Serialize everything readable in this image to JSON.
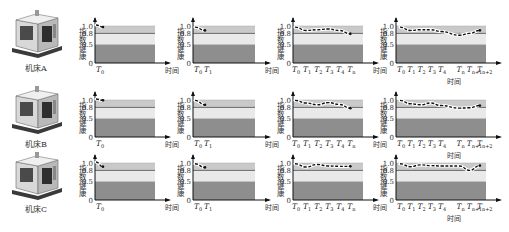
{
  "figure": {
    "machines": [
      {
        "label": "机床A"
      },
      {
        "label": "机床B"
      },
      {
        "label": "机床C"
      }
    ],
    "y_axis_label": "指数健康",
    "x_axis_label": "时间",
    "y_ticks": [
      "1.0",
      "0.8",
      "0.5",
      "0"
    ],
    "bands": {
      "high": "#c9c9c9",
      "mid": "#e9e9e9",
      "low": "#8e8e8e",
      "line08": "#6a6a6a"
    },
    "time_labels": {
      "c1": [
        {
          "t": "T",
          "s": "0"
        }
      ],
      "c2": [
        {
          "t": "T",
          "s": "0"
        },
        {
          "t": "T",
          "s": "1"
        }
      ],
      "c3": [
        {
          "t": "T",
          "s": "0"
        },
        {
          "t": "T",
          "s": "1"
        },
        {
          "t": "T",
          "s": "2"
        },
        {
          "t": "T",
          "s": "3"
        },
        {
          "t": "T",
          "s": "4"
        },
        {
          "t": "T",
          "s": "n"
        }
      ],
      "c4": [
        {
          "t": "T",
          "s": "0"
        },
        {
          "t": "T",
          "s": "1"
        },
        {
          "t": "T",
          "s": "2"
        },
        {
          "t": "T",
          "s": "3"
        },
        {
          "t": "T",
          "s": "4"
        },
        {
          "t": "T",
          "s": "n"
        },
        {
          "t": "T",
          "s": "n+1"
        },
        {
          "t": "T",
          "s": "n+2"
        }
      ]
    }
  },
  "chart_data": [
    {
      "type": "line",
      "machine": "机床A",
      "stage": 1,
      "x": [
        "T0"
      ],
      "values": [
        0.97
      ],
      "ylim": [
        0,
        1.1
      ],
      "xlabel": "时间",
      "ylabel": "指数健康",
      "bands": [
        0.5,
        0.8,
        1.0
      ]
    },
    {
      "type": "line",
      "machine": "机床A",
      "stage": 2,
      "x": [
        "T0",
        "T1"
      ],
      "values": [
        0.97,
        0.88
      ],
      "ylim": [
        0,
        1.1
      ],
      "xlabel": "时间",
      "ylabel": "指数健康"
    },
    {
      "type": "line",
      "machine": "机床A",
      "stage": 3,
      "x": [
        "T0",
        "T1",
        "T2",
        "T3",
        "T4",
        "Tn"
      ],
      "values": [
        0.97,
        0.88,
        0.9,
        0.92,
        0.88,
        0.79
      ],
      "ylim": [
        0,
        1.1
      ],
      "xlabel": "时间",
      "ylabel": "指数健康"
    },
    {
      "type": "line",
      "machine": "机床A",
      "stage": 4,
      "x": [
        "T0",
        "T1",
        "T2",
        "T3",
        "T4",
        "Tn",
        "Tn+1",
        "Tn+2"
      ],
      "values": [
        0.97,
        0.88,
        0.9,
        0.9,
        0.85,
        0.75,
        0.8,
        0.88
      ],
      "ylim": [
        0,
        1.1
      ],
      "xlabel": "时间",
      "ylabel": "指数健康"
    },
    {
      "type": "line",
      "machine": "机床B",
      "stage": 1,
      "x": [
        "T0"
      ],
      "values": [
        0.99
      ],
      "ylim": [
        0,
        1.1
      ],
      "xlabel": "时间",
      "ylabel": "指数健康"
    },
    {
      "type": "line",
      "machine": "机床B",
      "stage": 2,
      "x": [
        "T0",
        "T1"
      ],
      "values": [
        0.99,
        0.87
      ],
      "ylim": [
        0,
        1.1
      ],
      "xlabel": "时间",
      "ylabel": "指数健康"
    },
    {
      "type": "line",
      "machine": "机床B",
      "stage": 3,
      "x": [
        "T0",
        "T1",
        "T2",
        "T3",
        "T4",
        "Tn"
      ],
      "values": [
        0.99,
        0.92,
        0.87,
        0.93,
        0.88,
        0.78
      ],
      "ylim": [
        0,
        1.1
      ],
      "xlabel": "时间",
      "ylabel": "指数健康"
    },
    {
      "type": "line",
      "machine": "机床B",
      "stage": 4,
      "x": [
        "T0",
        "T1",
        "T2",
        "T3",
        "T4",
        "Tn",
        "Tn+1",
        "Tn+2"
      ],
      "values": [
        0.99,
        0.9,
        0.87,
        0.92,
        0.85,
        0.78,
        0.79,
        0.85
      ],
      "ylim": [
        0,
        1.1
      ],
      "xlabel": "时间",
      "ylabel": "指数健康"
    },
    {
      "type": "line",
      "machine": "机床C",
      "stage": 1,
      "x": [
        "T0"
      ],
      "values": [
        0.9
      ],
      "ylim": [
        0,
        1.1
      ],
      "xlabel": "时间",
      "ylabel": "指数健康"
    },
    {
      "type": "line",
      "machine": "机床C",
      "stage": 2,
      "x": [
        "T0",
        "T1"
      ],
      "values": [
        0.98,
        0.88
      ],
      "ylim": [
        0,
        1.1
      ],
      "xlabel": "时间",
      "ylabel": "指数健康"
    },
    {
      "type": "line",
      "machine": "机床C",
      "stage": 3,
      "x": [
        "T0",
        "T1",
        "T2",
        "T3",
        "T4",
        "Tn"
      ],
      "values": [
        0.98,
        0.89,
        0.96,
        0.92,
        0.91,
        0.91
      ],
      "ylim": [
        0,
        1.1
      ],
      "xlabel": "时间",
      "ylabel": "指数健康"
    },
    {
      "type": "line",
      "machine": "机床C",
      "stage": 4,
      "x": [
        "T0",
        "T1",
        "T2",
        "T3",
        "T4",
        "Tn",
        "Tn+1",
        "Tn+2"
      ],
      "values": [
        0.98,
        0.9,
        0.95,
        0.93,
        0.92,
        0.92,
        0.8,
        0.93
      ],
      "ylim": [
        0,
        1.1
      ],
      "xlabel": "时间",
      "ylabel": "指数健康"
    }
  ]
}
